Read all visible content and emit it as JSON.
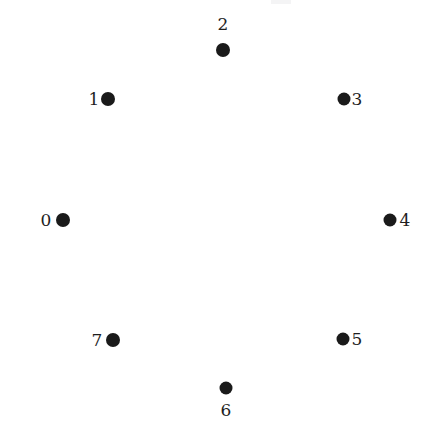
{
  "figure": {
    "title": "",
    "background_color": "#ffffff",
    "node_color": "#1a1a1a",
    "label_color": "#1e1e1e",
    "width": 428,
    "height": 428
  },
  "diagram": {
    "type": "node-layout",
    "shape": "octagon-ring",
    "center": {
      "x": 226,
      "y": 220
    },
    "node_count": 8,
    "node_radius_px": 7,
    "nodes": [
      {
        "id": "0",
        "label": "0",
        "dot_x": 63,
        "dot_y": 220,
        "label_x": 46,
        "label_y": 220,
        "label_side": "left"
      },
      {
        "id": "1",
        "label": "1",
        "dot_x": 108,
        "dot_y": 99,
        "label_x": 94,
        "label_y": 99,
        "label_side": "left"
      },
      {
        "id": "2",
        "label": "2",
        "dot_x": 223,
        "dot_y": 50,
        "label_x": 223,
        "label_y": 24,
        "label_side": "top"
      },
      {
        "id": "3",
        "label": "3",
        "dot_x": 344,
        "dot_y": 99,
        "label_x": 357,
        "label_y": 99,
        "label_side": "right"
      },
      {
        "id": "4",
        "label": "4",
        "dot_x": 390,
        "dot_y": 220,
        "label_x": 405,
        "label_y": 220,
        "label_side": "right"
      },
      {
        "id": "5",
        "label": "5",
        "dot_x": 343,
        "dot_y": 339,
        "label_x": 357,
        "label_y": 339,
        "label_side": "right"
      },
      {
        "id": "6",
        "label": "6",
        "dot_x": 226,
        "dot_y": 388,
        "label_x": 226,
        "label_y": 410,
        "label_side": "bottom"
      },
      {
        "id": "7",
        "label": "7",
        "dot_x": 113,
        "dot_y": 340,
        "label_x": 97,
        "label_y": 340,
        "label_side": "left"
      }
    ]
  }
}
